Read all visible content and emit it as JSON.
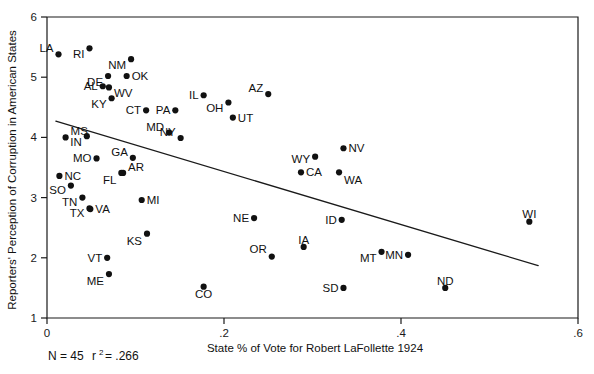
{
  "chart_data": {
    "type": "scatter",
    "title": "",
    "xlabel": "State % of Vote for Robert LaFollette 1924",
    "ylabel": "Reporters' Perception of Corruption in American States",
    "xlim": [
      0,
      0.6
    ],
    "ylim": [
      1,
      6
    ],
    "xticks": [
      0,
      0.2,
      0.4,
      0.6
    ],
    "xtick_labels": [
      "0",
      ".2",
      ".4",
      ".6"
    ],
    "yticks": [
      1,
      2,
      3,
      4,
      5,
      6
    ],
    "ytick_labels": [
      "1",
      "2",
      "3",
      "4",
      "5",
      "6"
    ],
    "grid": false,
    "legend": null,
    "point_labels_shown": true,
    "trendline": {
      "type": "linear-fit",
      "x_start": 0.01,
      "y_start": 4.27,
      "x_end": 0.555,
      "y_end": 1.87
    },
    "annotations": {
      "n_label": "N = 45",
      "r2_label": "r",
      "r2_exponent": "2",
      "r2_value": "= .266",
      "full_text": "N = 45 r2 = .266"
    },
    "points": [
      {
        "label": "LA",
        "x": 0.013,
        "y": 5.38,
        "lx": -0.5,
        "ly": -0.5
      },
      {
        "label": "RI",
        "x": 0.048,
        "y": 5.48,
        "lx": -0.5,
        "ly": 0.5
      },
      {
        "label": "NM",
        "x": 0.095,
        "y": 5.3,
        "lx": -0.5,
        "ly": 0.5
      },
      {
        "label": "DE",
        "x": 0.069,
        "y": 5.02,
        "lx": -0.5,
        "ly": 0.5
      },
      {
        "label": "OK",
        "x": 0.09,
        "y": 5.02,
        "lx": 0.5,
        "ly": 0
      },
      {
        "label": "AL",
        "x": 0.063,
        "y": 4.85,
        "lx": -0.5,
        "ly": 0
      },
      {
        "label": "WV",
        "x": 0.07,
        "y": 4.83,
        "lx": 0.5,
        "ly": 0.5
      },
      {
        "label": "KY",
        "x": 0.073,
        "y": 4.65,
        "lx": -0.5,
        "ly": 0.5
      },
      {
        "label": "AZ",
        "x": 0.25,
        "y": 4.72,
        "lx": -0.5,
        "ly": -0.5
      },
      {
        "label": "IL",
        "x": 0.177,
        "y": 4.7,
        "lx": -0.5,
        "ly": 0
      },
      {
        "label": "OH",
        "x": 0.205,
        "y": 4.58,
        "lx": -0.5,
        "ly": 0.5
      },
      {
        "label": "CT",
        "x": 0.112,
        "y": 4.45,
        "lx": -0.5,
        "ly": 0
      },
      {
        "label": "PA",
        "x": 0.145,
        "y": 4.45,
        "lx": -0.5,
        "ly": 0
      },
      {
        "label": "UT",
        "x": 0.21,
        "y": 4.33,
        "lx": 0.5,
        "ly": 0
      },
      {
        "label": "MD",
        "x": 0.138,
        "y": 4.08,
        "lx": -0.5,
        "ly": -0.5
      },
      {
        "label": "NY",
        "x": 0.151,
        "y": 3.99,
        "lx": -0.5,
        "ly": -0.5
      },
      {
        "label": "MS",
        "x": 0.021,
        "y": 4.0,
        "lx": 0.5,
        "ly": -0.5
      },
      {
        "label": "IN",
        "x": 0.045,
        "y": 4.02,
        "lx": -0.5,
        "ly": 0.5
      },
      {
        "label": "MO",
        "x": 0.056,
        "y": 3.65,
        "lx": -0.5,
        "ly": 0
      },
      {
        "label": "GA",
        "x": 0.097,
        "y": 3.66,
        "lx": -0.5,
        "ly": -0.5
      },
      {
        "label": "AR",
        "x": 0.086,
        "y": 3.41,
        "lx": 0.5,
        "ly": -0.5
      },
      {
        "label": "FL",
        "x": 0.084,
        "y": 3.41,
        "lx": -0.4,
        "ly": 0.6
      },
      {
        "label": "NC",
        "x": 0.014,
        "y": 3.36,
        "lx": 0.5,
        "ly": 0
      },
      {
        "label": "SO",
        "x": 0.027,
        "y": 3.2,
        "lx": -0.5,
        "ly": 0.4
      },
      {
        "label": "NV",
        "x": 0.335,
        "y": 3.82,
        "lx": 0.5,
        "ly": 0
      },
      {
        "label": "WY",
        "x": 0.303,
        "y": 3.68,
        "lx": -0.5,
        "ly": 0.2
      },
      {
        "label": "CA",
        "x": 0.287,
        "y": 3.42,
        "lx": 0.5,
        "ly": 0
      },
      {
        "label": "WA",
        "x": 0.33,
        "y": 3.42,
        "lx": 0.4,
        "ly": 0.6
      },
      {
        "label": "TN",
        "x": 0.04,
        "y": 3.0,
        "lx": -0.5,
        "ly": 0.4
      },
      {
        "label": "MI",
        "x": 0.107,
        "y": 2.96,
        "lx": 0.5,
        "ly": 0
      },
      {
        "label": "TX",
        "x": 0.048,
        "y": 2.82,
        "lx": -0.5,
        "ly": 0.4
      },
      {
        "label": "VA",
        "x": 0.049,
        "y": 2.81,
        "lx": 0.5,
        "ly": 0
      },
      {
        "label": "ID",
        "x": 0.333,
        "y": 2.63,
        "lx": -0.5,
        "ly": 0
      },
      {
        "label": "NE",
        "x": 0.234,
        "y": 2.66,
        "lx": -0.5,
        "ly": 0
      },
      {
        "label": "WI",
        "x": 0.545,
        "y": 2.6,
        "lx": -0.3,
        "ly": -0.6
      },
      {
        "label": "KS",
        "x": 0.113,
        "y": 2.4,
        "lx": -0.4,
        "ly": 0.6
      },
      {
        "label": "IA",
        "x": 0.29,
        "y": 2.18,
        "lx": -0.3,
        "ly": -0.6
      },
      {
        "label": "OR",
        "x": 0.254,
        "y": 2.02,
        "lx": -0.4,
        "ly": -0.6
      },
      {
        "label": "MT",
        "x": 0.378,
        "y": 2.1,
        "lx": -0.5,
        "ly": 0.5
      },
      {
        "label": "MN",
        "x": 0.408,
        "y": 2.05,
        "lx": -0.5,
        "ly": 0
      },
      {
        "label": "VT",
        "x": 0.068,
        "y": 2.0,
        "lx": -0.5,
        "ly": 0
      },
      {
        "label": "ME",
        "x": 0.07,
        "y": 1.73,
        "lx": -0.4,
        "ly": 0.6
      },
      {
        "label": "SD",
        "x": 0.335,
        "y": 1.5,
        "lx": -0.5,
        "ly": 0
      },
      {
        "label": "ND",
        "x": 0.45,
        "y": 1.5,
        "lx": -0.3,
        "ly": -0.6
      },
      {
        "label": "CO",
        "x": 0.177,
        "y": 1.52,
        "lx": -0.3,
        "ly": 0.6
      }
    ]
  }
}
